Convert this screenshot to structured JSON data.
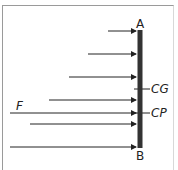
{
  "diagram": {
    "type": "force-distribution-on-plate",
    "labels": {
      "top": "A",
      "bottom": "B",
      "center_gravity": "CG",
      "center_pressure": "CP",
      "resultant_force": "F"
    },
    "bar": {
      "x": 140,
      "y_top": 30,
      "y_bottom": 148,
      "color": "#333333"
    },
    "arrows": [
      {
        "y": 31,
        "x_start": 108
      },
      {
        "y": 54,
        "x_start": 88
      },
      {
        "y": 77,
        "x_start": 69
      },
      {
        "y": 100,
        "x_start": 49
      },
      {
        "y": 124,
        "x_start": 30
      },
      {
        "y": 147,
        "x_start": 10
      }
    ],
    "resultant": {
      "y": 113,
      "x_start": 10,
      "label": "F"
    },
    "markers": [
      {
        "name": "CG",
        "y": 89
      },
      {
        "name": "CP",
        "y": 113
      }
    ]
  }
}
